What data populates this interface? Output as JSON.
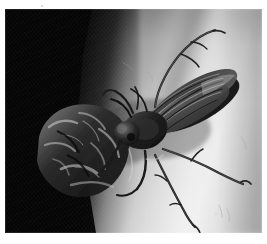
{
  "image": {
    "kind": "macro-photograph",
    "caption": "Black spider wasp gripping a dark captured prey insect against a pale human arm",
    "subject": "spider wasp (Pompilidae) with prey",
    "orientation": "landscape",
    "width_px": 267,
    "height_px": 244,
    "border": {
      "color": "#ffffff",
      "left_px": 5,
      "top_px": 9,
      "right_px": 5,
      "bottom_px": 11
    }
  },
  "palette": {
    "plate_border": "#ffffff",
    "fabric_black": "#070707",
    "background_mid_gray": "#9a9a9a",
    "background_dark_gray": "#6e6e6e",
    "specular_highlight": "#ebebeb",
    "insect_body_dark": "#121212",
    "insect_body_mid": "#3b3b3b",
    "insect_sheen": "#cfcfcf",
    "wing_gray": "#5a5a5a",
    "leg_gray": "#4a4a4a"
  },
  "scene": {
    "background": {
      "name": "pale-skin-arm",
      "description": "out of focus forearm lit from the lower right with a long specular band",
      "gradient_angle_deg": 106,
      "highlight_band": "diagonal, upper-right to lower-centre"
    },
    "fabric": {
      "name": "dark-knit-fabric",
      "description": "near-black knit garment occupying the left third of the frame",
      "edge_path": "runs from upper-centre down-left then back out toward the lower-centre"
    },
    "wasp": {
      "name": "spider-wasp",
      "body_segments": [
        "head",
        "thorax",
        "abdomen"
      ],
      "wings": 2,
      "wing_orientation": "folded back over the abdomen, pointing upper-right",
      "legs_visible": 5,
      "antennae_visible": 2,
      "pose": "head-down at centre-left, abdomen angled to the upper right",
      "center_px": [
        150,
        115
      ]
    },
    "prey": {
      "name": "captured-prey-insect",
      "description": "dark crumpled insect held in the wasp's grip, silhouetted on the fabric",
      "center_px": [
        78,
        140
      ]
    },
    "appendages": [
      {
        "name": "antenna-upper-right",
        "path": "rises from the head, arcs up and right toward the top edge"
      },
      {
        "name": "antenna-upper-left",
        "path": "short spur toward the upper left of the thorax"
      },
      {
        "name": "leg-mid-right",
        "path": "extends right across the highlight band, ends near the right edge"
      },
      {
        "name": "leg-hind-right",
        "path": "sweeps down and right to the lower edge"
      },
      {
        "name": "leg-fore",
        "path": "bent forward gripping the prey"
      }
    ],
    "dust_specks": [
      {
        "x_px": 41,
        "y_px": 5,
        "size_px": 2
      },
      {
        "x_px": 232,
        "y_px": 205,
        "size_px": 2
      },
      {
        "x_px": 215,
        "y_px": 213,
        "size_px": 2
      }
    ]
  }
}
